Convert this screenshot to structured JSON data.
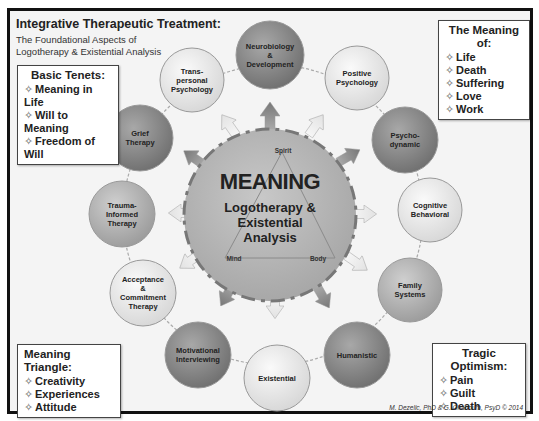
{
  "header": {
    "title": "Integrative Therapeutic Treatment:",
    "subtitle_line1": "The Foundational Aspects of",
    "subtitle_line2": "Logotherapy & Existential Analysis"
  },
  "boxes": {
    "basic_tenets": {
      "head": "Basic Tenets:",
      "items": [
        "Meaning in Life",
        "Will to Meaning",
        "Freedom of Will"
      ]
    },
    "meaning_of": {
      "head": "The Meaning of:",
      "items": [
        "Life",
        "Death",
        "Suffering",
        "Love",
        "Work"
      ]
    },
    "meaning_triangle": {
      "head": "Meaning Triangle:",
      "items": [
        "Creativity",
        "Experiences",
        "Attitude"
      ]
    },
    "tragic_optimism": {
      "head": "Tragic Optimism:",
      "items": [
        "Pain",
        "Guilt",
        "Death"
      ]
    }
  },
  "center": {
    "title": "MEANING",
    "subtitle": "Logotherapy &\nExistential\nAnalysis",
    "triangle": {
      "top": "Spirit",
      "left": "Mind",
      "right": "Body"
    }
  },
  "nodes": [
    {
      "label": "Neurobiology\n&\nDevelopment",
      "shade": "dark"
    },
    {
      "label": "Positive\nPsychology",
      "shade": "light"
    },
    {
      "label": "Psycho-\ndynamic",
      "shade": "dark"
    },
    {
      "label": "Cognitive\nBehavioral",
      "shade": "light"
    },
    {
      "label": "Family\nSystems",
      "shade": "mid"
    },
    {
      "label": "Humanistic",
      "shade": "dark"
    },
    {
      "label": "Existential",
      "shade": "light"
    },
    {
      "label": "Motivational\nInterviewing",
      "shade": "dark"
    },
    {
      "label": "Acceptance\n&\nCommitment\nTherapy",
      "shade": "light"
    },
    {
      "label": "Trauma-\nInformed\nTherapy",
      "shade": "mid"
    },
    {
      "label": "Grief\nTherapy",
      "shade": "dark"
    },
    {
      "label": "Trans-\npersonal\nPsychology",
      "shade": "light"
    }
  ],
  "credit": "M. Dezelic, PhD & G. Ghanoum, PsyD © 2014",
  "colors": {
    "dark": "#8a8a8a",
    "mid": "#b0b0b0",
    "light": "#e6e6e6",
    "center": "#b5b5b5",
    "frame": "#111111"
  }
}
